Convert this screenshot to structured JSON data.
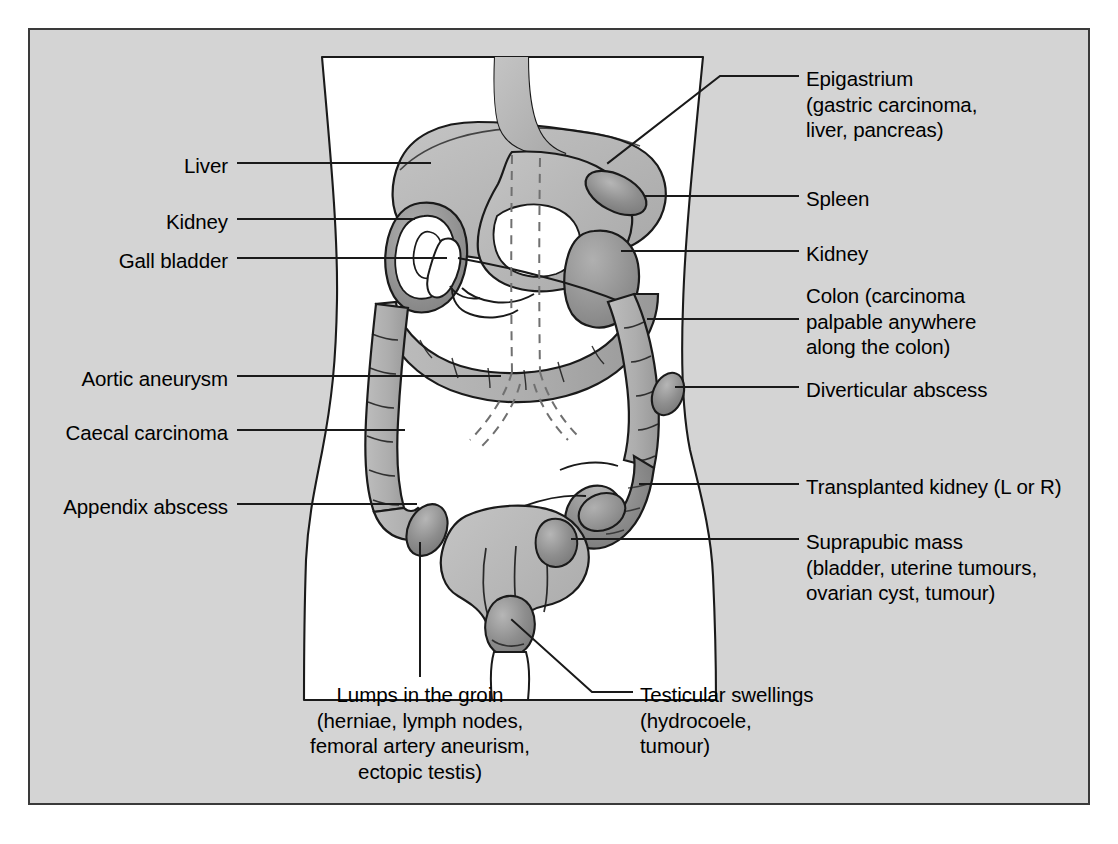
{
  "figure": {
    "frame_color": "#3a3a3a",
    "background_color": "#d4d4d4",
    "body_fill": "#ffffff",
    "organ_light": "#b3b3b3",
    "organ_mid": "#9a9a9a",
    "organ_dark": "#808080",
    "outline_color": "#1a1a1a"
  },
  "labels_right": [
    {
      "name": "epigastrium",
      "lines": [
        "Epigastrium",
        "(gastric carcinoma,",
        "liver, pancreas)"
      ],
      "text": "Epigastrium\n(gastric carcinoma,\nliver, pancreas)"
    },
    {
      "name": "spleen",
      "lines": [
        "Spleen"
      ],
      "text": "Spleen"
    },
    {
      "name": "kidney-right-label",
      "lines": [
        "Kidney"
      ],
      "text": "Kidney"
    },
    {
      "name": "colon",
      "lines": [
        "Colon (carcinoma",
        "palpable anywhere",
        "along the colon)"
      ],
      "text": "Colon (carcinoma\npalpable anywhere\nalong the colon)"
    },
    {
      "name": "diverticular-abscess",
      "lines": [
        "Diverticular abscess"
      ],
      "text": "Diverticular abscess"
    },
    {
      "name": "transplanted-kidney",
      "lines": [
        "Transplanted kidney (L or R)"
      ],
      "text": "Transplanted kidney (L or R)"
    },
    {
      "name": "suprapubic-mass",
      "lines": [
        "Suprapubic mass",
        "(bladder, uterine tumours,",
        "ovarian cyst, tumour)"
      ],
      "text": "Suprapubic mass\n(bladder, uterine tumours,\novarian cyst, tumour)"
    }
  ],
  "labels_left": [
    {
      "name": "liver",
      "text": "Liver"
    },
    {
      "name": "kidney-left-label",
      "text": "Kidney"
    },
    {
      "name": "gall-bladder",
      "text": "Gall bladder"
    },
    {
      "name": "aortic-aneurysm",
      "text": "Aortic aneurysm"
    },
    {
      "name": "caecal-carcinoma",
      "text": "Caecal carcinoma"
    },
    {
      "name": "appendix-abscess",
      "text": "Appendix abscess"
    }
  ],
  "labels_bottom": [
    {
      "name": "lumps-in-the-groin",
      "lines": [
        "Lumps in the groin",
        "(herniae, lymph nodes,",
        "femoral artery aneurism,",
        "ectopic testis)"
      ],
      "text": "Lumps in the groin\n(herniae, lymph nodes,\nfemoral artery aneurism,\nectopic testis)"
    },
    {
      "name": "testicular-swellings",
      "lines": [
        "Testicular swellings",
        "(hydrocoele,",
        "tumour)"
      ],
      "text": "Testicular swellings\n(hydrocoele,\ntumour)"
    }
  ],
  "anatomy_parts": [
    "body-torso-silhouette",
    "oesophagus",
    "liver-shape",
    "stomach-shape",
    "spleen-shape",
    "right-kidney-shape",
    "left-kidney-shape",
    "gall-bladder-shape",
    "duodenum-pancreas",
    "transverse-colon",
    "ascending-colon",
    "descending-colon",
    "sigmoid-colon",
    "caecum",
    "appendix-abscess-mass",
    "diverticular-abscess-mass",
    "transplanted-kidney-mass",
    "bladder-uterus-shape",
    "testis-shape",
    "aortic-aneurysm-dashed",
    "groin-lump-mass"
  ]
}
